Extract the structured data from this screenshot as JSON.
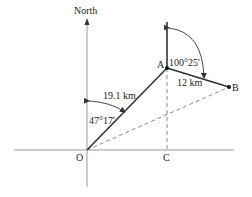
{
  "diagram": {
    "type": "bearing-navigation",
    "north_label": "North",
    "points": {
      "O": {
        "label": "O"
      },
      "A": {
        "label": "A"
      },
      "B": {
        "label": "B"
      },
      "C": {
        "label": "C"
      }
    },
    "segments": {
      "OA": {
        "length_label": "19.1 km"
      },
      "AB": {
        "length_label": "12 km"
      }
    },
    "angles": {
      "bearing_OA": "47°17'",
      "bearing_AB": "100°25'"
    },
    "colors": {
      "axis": "#9a9a9a",
      "solid_line": "#333333",
      "dashed_line": "#8a8a8a",
      "text": "#222222"
    }
  }
}
